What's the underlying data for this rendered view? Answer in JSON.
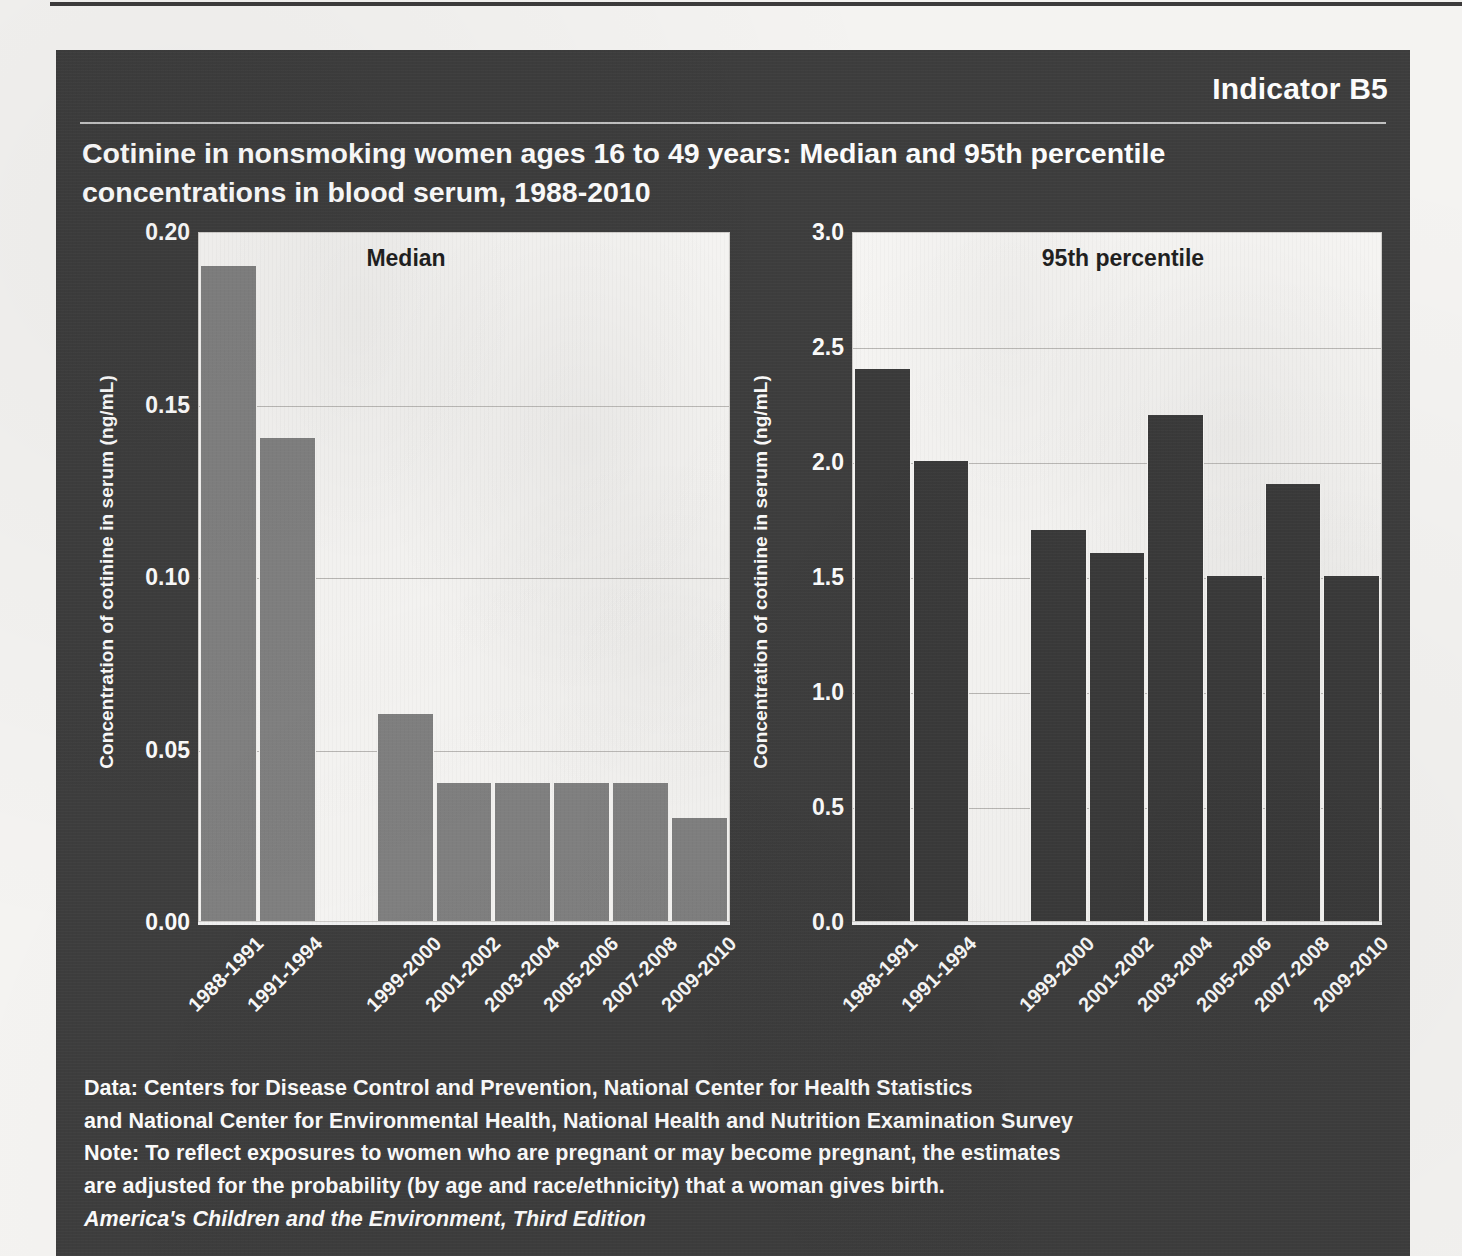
{
  "header": {
    "indicator": "Indicator B5",
    "title": "Cotinine in nonsmoking women ages 16 to 49 years: Median and 95th percentile concentrations in blood serum, 1988-2010"
  },
  "footer": {
    "lines": [
      "Data: Centers for Disease Control and Prevention, National Center for Health Statistics",
      "and National Center for Environmental Health, National Health and Nutrition Examination Survey",
      "Note: To reflect exposures to women who are pregnant or may become pregnant, the estimates",
      "are adjusted for the probability (by age and race/ethnicity) that a woman gives birth."
    ],
    "source": "America's Children and the Environment, Third Edition"
  },
  "colors": {
    "panel_background": "#3d3d3d",
    "plot_background": "#f6f5f3",
    "median_bar": "#808080",
    "percentile_bar": "#3a3a3a",
    "gridline": "#b9b7b4",
    "text_light": "#fcfcfc"
  },
  "chart_data": [
    {
      "type": "bar",
      "title": "Median",
      "xlabel": "",
      "ylabel": "Concentration of cotinine in serum (ng/mL)",
      "ylim": [
        0,
        0.2
      ],
      "yticks": [
        "0.00",
        "0.05",
        "0.10",
        "0.15",
        "0.20"
      ],
      "ytick_values": [
        0,
        0.05,
        0.1,
        0.15,
        0.2
      ],
      "grid": true,
      "legend": "none",
      "bar_color": "#808080",
      "categories": [
        "1988-1991",
        "1991-1994",
        "",
        "1999-2000",
        "2001-2002",
        "2003-2004",
        "2005-2006",
        "2007-2008",
        "2009-2010"
      ],
      "values": [
        0.19,
        0.14,
        null,
        0.06,
        0.04,
        0.04,
        0.04,
        0.04,
        0.03
      ]
    },
    {
      "type": "bar",
      "title": "95th percentile",
      "xlabel": "",
      "ylabel": "Concentration of cotinine in serum (ng/mL)",
      "ylim": [
        0,
        3.0
      ],
      "yticks": [
        "0.0",
        "0.5",
        "1.0",
        "1.5",
        "2.0",
        "2.5",
        "3.0"
      ],
      "ytick_values": [
        0,
        0.5,
        1.0,
        1.5,
        2.0,
        2.5,
        3.0
      ],
      "grid": true,
      "legend": "none",
      "bar_color": "#3a3a3a",
      "categories": [
        "1988-1991",
        "1991-1994",
        "",
        "1999-2000",
        "2001-2002",
        "2003-2004",
        "2005-2006",
        "2007-2008",
        "2009-2010"
      ],
      "values": [
        2.4,
        2.0,
        null,
        1.7,
        1.6,
        2.2,
        1.5,
        1.9,
        1.5
      ]
    }
  ]
}
